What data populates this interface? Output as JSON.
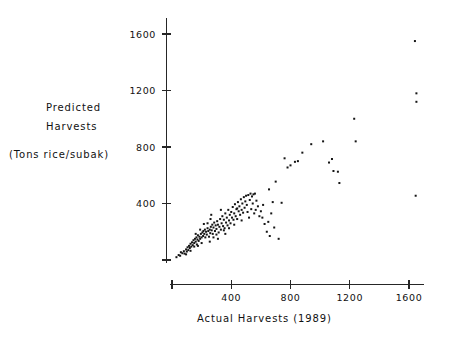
{
  "chart_data": {
    "type": "scatter",
    "title": "",
    "xlabel": "Actual Harvests   (1989)",
    "ylabel_line1": "Predicted",
    "ylabel_line2": "Harvests",
    "ylabel_units": "(Tons rice/subak)",
    "xlim": [
      0,
      1760
    ],
    "ylim": [
      0,
      1760
    ],
    "grid": false,
    "legend": "none",
    "xticks": [
      400,
      800,
      1200,
      1600
    ],
    "xtick_labels": [
      "400",
      "800",
      "1200",
      "1600"
    ],
    "yticks": [
      400,
      800,
      1200,
      1600
    ],
    "ytick_labels": [
      "400",
      "800",
      "1200",
      "1600"
    ],
    "point_color": "#151515",
    "axis_color": "#262626",
    "background_color": "#ffffff",
    "points": [
      [
        30,
        20
      ],
      [
        45,
        35
      ],
      [
        55,
        30
      ],
      [
        60,
        55
      ],
      [
        70,
        48
      ],
      [
        80,
        62
      ],
      [
        85,
        45
      ],
      [
        95,
        75
      ],
      [
        100,
        60
      ],
      [
        105,
        90
      ],
      [
        110,
        70
      ],
      [
        115,
        100
      ],
      [
        120,
        85
      ],
      [
        125,
        115
      ],
      [
        130,
        95
      ],
      [
        135,
        125
      ],
      [
        140,
        105
      ],
      [
        145,
        140
      ],
      [
        150,
        120
      ],
      [
        155,
        150
      ],
      [
        160,
        130
      ],
      [
        165,
        160
      ],
      [
        168,
        110
      ],
      [
        172,
        145
      ],
      [
        175,
        175
      ],
      [
        180,
        135
      ],
      [
        185,
        165
      ],
      [
        190,
        150
      ],
      [
        195,
        185
      ],
      [
        200,
        160
      ],
      [
        205,
        195
      ],
      [
        210,
        170
      ],
      [
        212,
        205
      ],
      [
        218,
        185
      ],
      [
        222,
        215
      ],
      [
        225,
        160
      ],
      [
        230,
        200
      ],
      [
        235,
        180
      ],
      [
        240,
        225
      ],
      [
        245,
        205
      ],
      [
        250,
        165
      ],
      [
        255,
        215
      ],
      [
        258,
        190
      ],
      [
        262,
        235
      ],
      [
        268,
        210
      ],
      [
        272,
        250
      ],
      [
        275,
        185
      ],
      [
        280,
        230
      ],
      [
        285,
        265
      ],
      [
        290,
        205
      ],
      [
        295,
        245
      ],
      [
        300,
        220
      ],
      [
        305,
        275
      ],
      [
        310,
        250
      ],
      [
        315,
        195
      ],
      [
        320,
        235
      ],
      [
        325,
        290
      ],
      [
        330,
        215
      ],
      [
        335,
        260
      ],
      [
        340,
        310
      ],
      [
        345,
        240
      ],
      [
        350,
        285
      ],
      [
        355,
        225
      ],
      [
        360,
        330
      ],
      [
        365,
        265
      ],
      [
        370,
        300
      ],
      [
        375,
        245
      ],
      [
        380,
        355
      ],
      [
        385,
        280
      ],
      [
        390,
        320
      ],
      [
        395,
        260
      ],
      [
        400,
        340
      ],
      [
        405,
        300
      ],
      [
        410,
        375
      ],
      [
        415,
        285
      ],
      [
        420,
        330
      ],
      [
        425,
        395
      ],
      [
        430,
        310
      ],
      [
        435,
        360
      ],
      [
        440,
        290
      ],
      [
        445,
        410
      ],
      [
        450,
        345
      ],
      [
        455,
        380
      ],
      [
        460,
        320
      ],
      [
        465,
        430
      ],
      [
        470,
        355
      ],
      [
        475,
        400
      ],
      [
        480,
        335
      ],
      [
        485,
        445
      ],
      [
        490,
        370
      ],
      [
        495,
        415
      ],
      [
        500,
        455
      ],
      [
        505,
        390
      ],
      [
        510,
        340
      ],
      [
        515,
        460
      ],
      [
        520,
        300
      ],
      [
        525,
        425
      ],
      [
        530,
        470
      ],
      [
        535,
        360
      ],
      [
        540,
        450
      ],
      [
        545,
        400
      ],
      [
        550,
        465
      ],
      [
        555,
        330
      ],
      [
        560,
        470
      ],
      [
        565,
        355
      ],
      [
        570,
        420
      ],
      [
        580,
        380
      ],
      [
        590,
        310
      ],
      [
        600,
        345
      ],
      [
        610,
        300
      ],
      [
        615,
        390
      ],
      [
        625,
        255
      ],
      [
        640,
        200
      ],
      [
        650,
        270
      ],
      [
        655,
        500
      ],
      [
        660,
        170
      ],
      [
        670,
        330
      ],
      [
        680,
        410
      ],
      [
        690,
        230
      ],
      [
        700,
        555
      ],
      [
        720,
        150
      ],
      [
        740,
        405
      ],
      [
        760,
        720
      ],
      [
        780,
        655
      ],
      [
        800,
        670
      ],
      [
        830,
        695
      ],
      [
        850,
        700
      ],
      [
        880,
        760
      ],
      [
        940,
        820
      ],
      [
        1020,
        840
      ],
      [
        1060,
        690
      ],
      [
        1080,
        715
      ],
      [
        1090,
        630
      ],
      [
        1120,
        625
      ],
      [
        1130,
        545
      ],
      [
        1230,
        1000
      ],
      [
        1240,
        840
      ],
      [
        1640,
        1550
      ],
      [
        1650,
        1180
      ],
      [
        1650,
        1120
      ],
      [
        1645,
        455
      ],
      [
        260,
        290
      ],
      [
        215,
        255
      ],
      [
        300,
        180
      ],
      [
        350,
        210
      ],
      [
        190,
        215
      ],
      [
        240,
        260
      ],
      [
        160,
        185
      ],
      [
        280,
        160
      ],
      [
        420,
        250
      ],
      [
        385,
        225
      ],
      [
        470,
        280
      ],
      [
        330,
        355
      ],
      [
        265,
        320
      ],
      [
        440,
        365
      ],
      [
        150,
        95
      ],
      [
        125,
        65
      ],
      [
        95,
        40
      ],
      [
        200,
        120
      ],
      [
        175,
        100
      ],
      [
        360,
        185
      ],
      [
        310,
        150
      ],
      [
        255,
        130
      ]
    ]
  }
}
